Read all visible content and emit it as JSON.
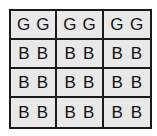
{
  "figure": {
    "name": "letter-grid",
    "columns": 3,
    "rows": 4,
    "letters_per_cell": 2,
    "colors": {
      "page_background": "#ffffff",
      "cell_background": "#e8e8e8",
      "grid_line": "#1a1a1a",
      "letter": "#121212"
    },
    "cells": [
      {
        "row": 0,
        "col": 0,
        "letters": [
          "G",
          "G"
        ]
      },
      {
        "row": 0,
        "col": 1,
        "letters": [
          "G",
          "G"
        ]
      },
      {
        "row": 0,
        "col": 2,
        "letters": [
          "G",
          "G"
        ]
      },
      {
        "row": 1,
        "col": 0,
        "letters": [
          "B",
          "B"
        ]
      },
      {
        "row": 1,
        "col": 1,
        "letters": [
          "B",
          "B"
        ]
      },
      {
        "row": 1,
        "col": 2,
        "letters": [
          "B",
          "B"
        ]
      },
      {
        "row": 2,
        "col": 0,
        "letters": [
          "B",
          "B"
        ]
      },
      {
        "row": 2,
        "col": 1,
        "letters": [
          "B",
          "B"
        ]
      },
      {
        "row": 2,
        "col": 2,
        "letters": [
          "B",
          "B"
        ]
      },
      {
        "row": 3,
        "col": 0,
        "letters": [
          "B",
          "B"
        ]
      },
      {
        "row": 3,
        "col": 1,
        "letters": [
          "B",
          "B"
        ]
      },
      {
        "row": 3,
        "col": 2,
        "letters": [
          "B",
          "B"
        ]
      }
    ]
  }
}
